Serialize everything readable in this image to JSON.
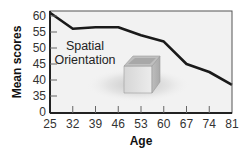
{
  "chart_data": {
    "type": "line",
    "title": "",
    "xlabel": "Age",
    "ylabel": "Mean scores",
    "x": [
      25,
      32,
      39,
      46,
      53,
      60,
      67,
      74,
      81
    ],
    "series": [
      {
        "name": "Spatial Orientation",
        "values": [
          61,
          56,
          56.5,
          56.5,
          54,
          52,
          45,
          42.5,
          38.5
        ]
      }
    ],
    "x_tick_labels": [
      "25",
      "32",
      "39",
      "46",
      "53",
      "60",
      "67",
      "74",
      "81"
    ],
    "y_tick_labels": [
      "0",
      "35",
      "40",
      "45",
      "50",
      "55",
      "60"
    ],
    "ylim": [
      35,
      61
    ],
    "axis_break": "y-axis jumps from 0 to 35",
    "annotation": "Spatial Orientation",
    "grid": false,
    "legend": "none",
    "colors": {
      "line": "#1a1a1a",
      "plot_bg": "#f2f2f2",
      "frame": "#444444"
    }
  }
}
